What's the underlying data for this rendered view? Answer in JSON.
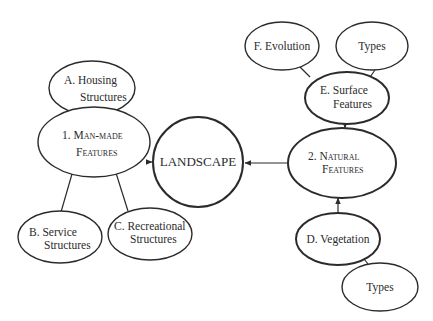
{
  "diagram": {
    "center": {
      "label": "LANDSCAPE"
    },
    "nodes": {
      "man_made": {
        "line1": "1. Man-made",
        "line2": "Features"
      },
      "natural": {
        "line1": "2. Natural",
        "line2": "Features"
      },
      "housing": {
        "line1": "A. Housing",
        "line2": "Structures"
      },
      "service": {
        "line1": "B. Service",
        "line2": "Structures"
      },
      "recreational": {
        "line1": "C. Recreational",
        "line2": "Structures"
      },
      "vegetation": {
        "line1": "D. Vegetation"
      },
      "surface": {
        "line1": "E. Surface",
        "line2": "Features"
      },
      "evolution": {
        "line1": "F. Evolution"
      },
      "surface_types": {
        "line1": "Types"
      },
      "vegetation_types": {
        "line1": "Types"
      }
    },
    "edges": [
      {
        "from": "housing",
        "to": "man_made",
        "arrow": true
      },
      {
        "from": "man_made",
        "to": "service",
        "arrow": false
      },
      {
        "from": "man_made",
        "to": "recreational",
        "arrow": false
      },
      {
        "from": "man_made",
        "to": "center",
        "arrow": true
      },
      {
        "from": "natural",
        "to": "center",
        "arrow": true
      },
      {
        "from": "surface",
        "to": "natural",
        "arrow": true
      },
      {
        "from": "evolution",
        "to": "surface",
        "arrow": false
      },
      {
        "from": "surface_types",
        "to": "surface",
        "arrow": false
      },
      {
        "from": "vegetation",
        "to": "natural",
        "arrow": true
      },
      {
        "from": "vegetation",
        "to": "vegetation_types",
        "arrow": false
      }
    ]
  }
}
